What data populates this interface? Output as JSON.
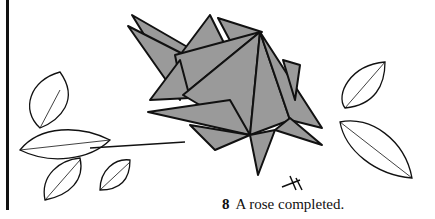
{
  "figure": {
    "number": "8",
    "caption": "A rose completed."
  },
  "colors": {
    "ink": "#111111",
    "paper_gray": "#9a9a9a",
    "background": "#ffffff"
  }
}
